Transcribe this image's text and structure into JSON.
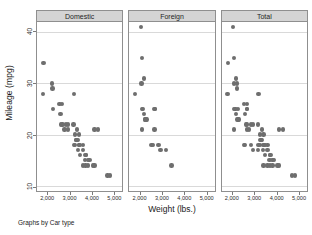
{
  "chart_data": {
    "type": "scatter",
    "title": "",
    "xlabel": "Weight (lbs.)",
    "ylabel": "Mileage (mpg)",
    "note": "Graphs by Car type",
    "xlim": [
      1500,
      5400
    ],
    "ylim": [
      9,
      42
    ],
    "xticks": [
      2000,
      3000,
      4000,
      5000
    ],
    "xticklabels": [
      "2,000",
      "3,000",
      "4,000",
      "5,000"
    ],
    "yticks": [
      10,
      20,
      30,
      40
    ],
    "yticklabels": [
      "10",
      "20",
      "30",
      "40"
    ],
    "grid": "horizontal",
    "legend": "none",
    "marker_color": "#6e6e6e",
    "panel_header_color": "#d4d4d4",
    "panel_border_color": "#8f8f8f",
    "gridline_color": "#d9d9d9",
    "panels": [
      {
        "label": "Domestic",
        "points": [
          [
            1800,
            34
          ],
          [
            1760,
            28
          ],
          [
            2190,
            30
          ],
          [
            2200,
            29
          ],
          [
            2240,
            25
          ],
          [
            2520,
            26
          ],
          [
            2650,
            26
          ],
          [
            2580,
            24
          ],
          [
            2600,
            22
          ],
          [
            2670,
            22
          ],
          [
            2750,
            21
          ],
          [
            2830,
            22
          ],
          [
            2930,
            22
          ],
          [
            3170,
            22
          ],
          [
            3190,
            28
          ],
          [
            3250,
            20
          ],
          [
            3280,
            19
          ],
          [
            3300,
            19
          ],
          [
            3350,
            19
          ],
          [
            3420,
            18
          ],
          [
            3470,
            18
          ],
          [
            3430,
            18
          ],
          [
            3600,
            18
          ],
          [
            3180,
            18
          ],
          [
            3380,
            17
          ],
          [
            3600,
            17
          ],
          [
            3720,
            16
          ],
          [
            3740,
            16
          ],
          [
            3690,
            15
          ],
          [
            3830,
            15
          ],
          [
            3900,
            15
          ],
          [
            3600,
            14
          ],
          [
            3720,
            14
          ],
          [
            3830,
            14
          ],
          [
            4060,
            14
          ],
          [
            4130,
            14
          ],
          [
            4130,
            21
          ],
          [
            4290,
            21
          ],
          [
            4720,
            12
          ],
          [
            4840,
            12
          ],
          [
            3330,
            21
          ],
          [
            3420,
            20
          ],
          [
            2930,
            21
          ],
          [
            3250,
            18
          ],
          [
            3470,
            16
          ]
        ]
      },
      {
        "label": "Foreign",
        "points": [
          [
            2020,
            41
          ],
          [
            2070,
            35
          ],
          [
            2160,
            31
          ],
          [
            2050,
            30
          ],
          [
            1760,
            28
          ],
          [
            2070,
            25
          ],
          [
            2130,
            25
          ],
          [
            2240,
            23
          ],
          [
            2230,
            23
          ],
          [
            2160,
            24
          ],
          [
            2280,
            23
          ],
          [
            2650,
            25
          ],
          [
            2670,
            25
          ],
          [
            2070,
            21
          ],
          [
            2650,
            21
          ],
          [
            2520,
            18
          ],
          [
            2580,
            18
          ],
          [
            2830,
            18
          ],
          [
            2930,
            17
          ],
          [
            3170,
            17
          ],
          [
            3420,
            14
          ]
        ]
      },
      {
        "label": "Total",
        "points": [
          [
            2020,
            41
          ],
          [
            1800,
            34
          ],
          [
            2070,
            35
          ],
          [
            2160,
            31
          ],
          [
            2050,
            30
          ],
          [
            2190,
            30
          ],
          [
            2200,
            29
          ],
          [
            1760,
            28
          ],
          [
            3190,
            28
          ],
          [
            2070,
            25
          ],
          [
            2130,
            25
          ],
          [
            2240,
            25
          ],
          [
            2520,
            26
          ],
          [
            2650,
            26
          ],
          [
            2160,
            24
          ],
          [
            2580,
            24
          ],
          [
            2240,
            23
          ],
          [
            2230,
            23
          ],
          [
            2280,
            23
          ],
          [
            2650,
            25
          ],
          [
            2670,
            25
          ],
          [
            2600,
            22
          ],
          [
            2670,
            22
          ],
          [
            2830,
            22
          ],
          [
            2930,
            22
          ],
          [
            3170,
            22
          ],
          [
            2070,
            21
          ],
          [
            2650,
            21
          ],
          [
            2750,
            21
          ],
          [
            3330,
            21
          ],
          [
            4130,
            21
          ],
          [
            4290,
            21
          ],
          [
            3250,
            20
          ],
          [
            3420,
            20
          ],
          [
            3280,
            19
          ],
          [
            3300,
            19
          ],
          [
            3350,
            19
          ],
          [
            2520,
            18
          ],
          [
            2580,
            18
          ],
          [
            2830,
            18
          ],
          [
            3180,
            18
          ],
          [
            3250,
            18
          ],
          [
            3420,
            18
          ],
          [
            3470,
            18
          ],
          [
            3430,
            18
          ],
          [
            3600,
            18
          ],
          [
            2930,
            17
          ],
          [
            3170,
            17
          ],
          [
            3380,
            17
          ],
          [
            3600,
            17
          ],
          [
            3470,
            16
          ],
          [
            3720,
            16
          ],
          [
            3740,
            16
          ],
          [
            3690,
            15
          ],
          [
            3830,
            15
          ],
          [
            3900,
            15
          ],
          [
            3420,
            14
          ],
          [
            3600,
            14
          ],
          [
            3720,
            14
          ],
          [
            3830,
            14
          ],
          [
            4060,
            14
          ],
          [
            4130,
            14
          ],
          [
            4720,
            12
          ],
          [
            4840,
            12
          ]
        ]
      }
    ]
  }
}
